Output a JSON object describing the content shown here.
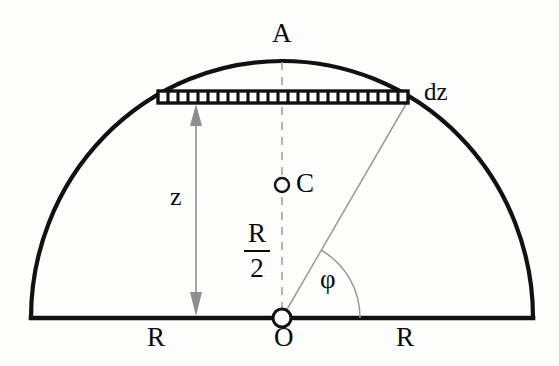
{
  "figure": {
    "kind": "geometry-diagram",
    "background_color": "#fdfdfc",
    "stroke_color": "#111111",
    "guide_color": "#9a9a9a",
    "arrow_color": "#8e8e8e"
  },
  "geometry": {
    "center": {
      "x": 282,
      "y": 318
    },
    "radius_x": 251,
    "radius_y": 257,
    "baseline": {
      "x1": 31,
      "x2": 533,
      "y": 318
    },
    "apex": {
      "x": 282,
      "y": 61
    },
    "band": {
      "x1": 158,
      "x2": 408,
      "y_top": 91,
      "y_bottom": 103,
      "tick_count": 24
    },
    "centroid_point": {
      "x": 282,
      "y": 185,
      "r": 7
    },
    "origin_point": {
      "x": 282,
      "y": 318,
      "r": 9
    },
    "radius_line": {
      "x1": 282,
      "y1": 318,
      "x2": 408,
      "y2": 100
    },
    "angle_arc_radius": 78,
    "z_arrow": {
      "x": 196,
      "y_top": 105,
      "y_bottom": 316
    }
  },
  "labels": {
    "apex": "A",
    "element": "dz",
    "centroid": "C",
    "height": "z",
    "angle": "φ",
    "radius_left": "R",
    "origin": "O",
    "radius_right": "R",
    "half_radius_numerator": "R",
    "half_radius_denominator": "2"
  }
}
